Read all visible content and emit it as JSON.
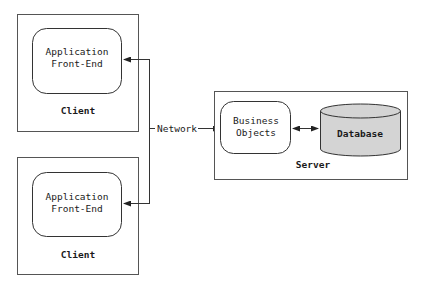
{
  "diagram": {
    "clients": [
      {
        "container_label": "Client",
        "component_lines": [
          "Application",
          "Front-End"
        ]
      },
      {
        "container_label": "Client",
        "component_lines": [
          "Application",
          "Front-End"
        ]
      }
    ],
    "network": {
      "label": "Network"
    },
    "server": {
      "container_label": "Server",
      "business_objects_lines": [
        "Business",
        "Objects"
      ],
      "database_label": "Database"
    },
    "colors": {
      "stroke": "#444444",
      "database_fill": "#d4d4d4",
      "background": "#ffffff"
    }
  }
}
